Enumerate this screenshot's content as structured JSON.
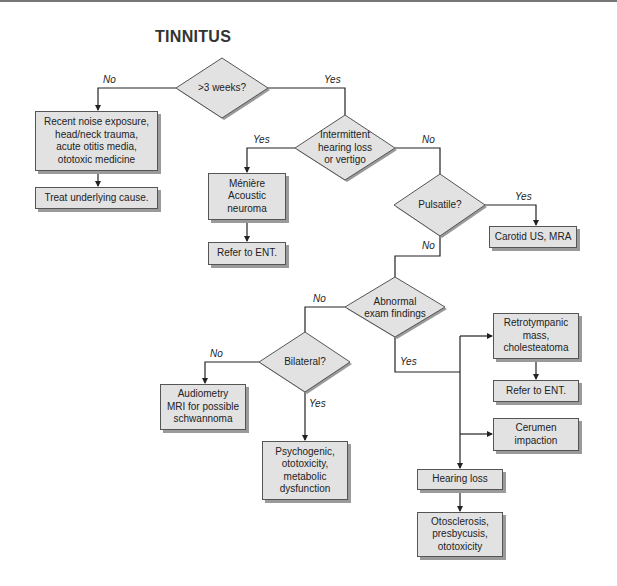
{
  "title": "TINNITUS",
  "decisions": {
    "duration": ">3 weeks?",
    "intermittent": "Intermittent\nhearing loss\nor vertigo",
    "pulsatile": "Pulsatile?",
    "abnormal": "Abnormal\nexam findings",
    "bilateral": "Bilateral?"
  },
  "boxes": {
    "acute_causes": "Recent noise exposure,\nhead/neck trauma,\nacute otitis media,\nototoxic medicine",
    "treat": "Treat underlying cause.",
    "meniere": "Ménière\nAcoustic\nneuroma",
    "refer_ent_1": "Refer to ENT.",
    "carotid": "Carotid US, MRA",
    "retrotympanic": "Retrotympanic\nmass,\ncholesteatoma",
    "refer_ent_2": "Refer to ENT.",
    "cerumen": "Cerumen\nimpaction",
    "hearing_loss": "Hearing loss",
    "otosclerosis": "Otosclerosis,\npresbycusis,\nototoxicity",
    "audiometry": "Audiometry\nMRI for possible\nschwannoma",
    "psychogenic": "Psychogenic,\nototoxicity,\nmetabolic\ndysfunction"
  },
  "edges": {
    "duration_no": "No",
    "duration_yes": "Yes",
    "intermittent_yes": "Yes",
    "intermittent_no": "No",
    "pulsatile_yes": "Yes",
    "pulsatile_no": "No",
    "abnormal_no": "No",
    "abnormal_yes": "Yes",
    "bilateral_no": "No",
    "bilateral_yes": "Yes"
  },
  "colors": {
    "fill": "#e2e2e2",
    "stroke": "#555555",
    "line": "#222222",
    "shadow": "#9a9a9a"
  }
}
